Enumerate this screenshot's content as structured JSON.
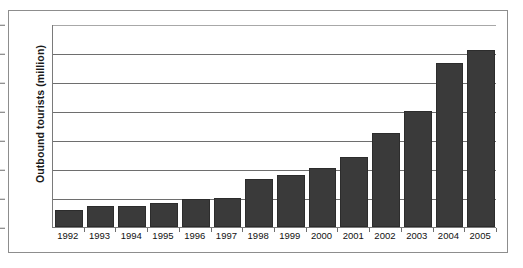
{
  "chart_data": {
    "type": "bar",
    "title": "",
    "xlabel": "",
    "ylabel": "Outbound tourists (million)",
    "categories": [
      "1992",
      "1993",
      "1994",
      "1995",
      "1996",
      "1997",
      "1998",
      "1999",
      "2000",
      "2001",
      "2002",
      "2003",
      "2004",
      "2005"
    ],
    "values": [
      2.9,
      3.6,
      3.6,
      4.2,
      4.9,
      5.0,
      8.3,
      8.9,
      10.2,
      12.0,
      16.3,
      20.0,
      28.3,
      30.5
    ],
    "ylim": [
      0,
      35
    ],
    "ytick_labels": [
      "0",
      "5",
      "10",
      "15",
      "20",
      "25",
      "30",
      "35"
    ],
    "ytick_values": [
      0,
      5,
      10,
      15,
      20,
      25,
      30,
      35
    ],
    "grid": true,
    "grid_axis": "y",
    "legend": false,
    "legend_position": "none",
    "bar_color": "#3a3a3a",
    "grid_color": "#6e6e6e",
    "axis_color": "#7a7a7a",
    "background_color": "#ffffff"
  }
}
